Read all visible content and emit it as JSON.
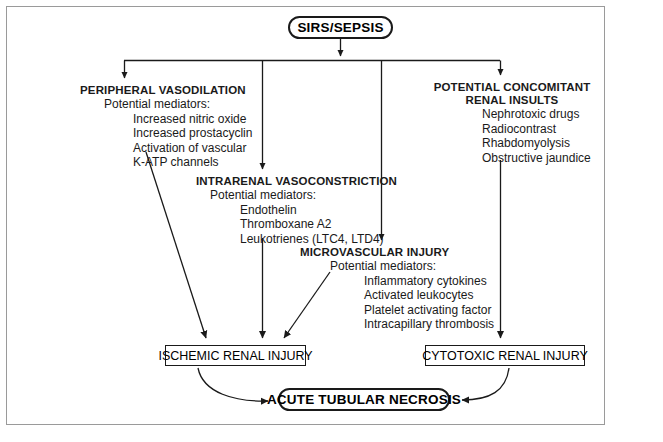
{
  "figure": {
    "root": {
      "label": "SIRS/SEPSIS"
    },
    "terminal": {
      "label": "ACUTE TUBULAR NECROSIS"
    },
    "outcomes": {
      "ischemic": "ISCHEMIC RENAL INJURY",
      "cytotoxic": "CYTOTOXIC RENAL INJURY"
    },
    "groups": {
      "peripheral": {
        "title": "PERIPHERAL VASODILATION",
        "subtitle": "Potential mediators:",
        "items": [
          "Increased nitric oxide",
          "Increased prostacyclin",
          "Activation of vascular",
          "K-ATP channels"
        ]
      },
      "intrarenal": {
        "title": "INTRARENAL VASOCONSTRICTION",
        "subtitle": "Potential mediators:",
        "items": [
          "Endothelin",
          "Thromboxane A2",
          "Leukotrienes (LTC4, LTD4)"
        ]
      },
      "microvascular": {
        "title": "MICROVASCULAR INJURY",
        "subtitle": "Potential mediators:",
        "items": [
          "Inflammatory cytokines",
          "Activated leukocytes",
          "Platelet activating factor",
          "Intracapillary thrombosis"
        ]
      },
      "concomitant": {
        "title_line1": "POTENTIAL CONCOMITANT",
        "title_line2": "RENAL INSULTS",
        "items": [
          "Nephrotoxic drugs",
          "Radiocontrast",
          "Rhabdomyolysis",
          "Obstructive jaundice"
        ]
      }
    },
    "colors": {
      "ink": "#1a1a1a",
      "frame": "#9a9a9a",
      "background": "#ffffff"
    }
  }
}
